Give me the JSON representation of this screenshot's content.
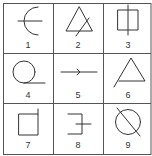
{
  "colors": {
    "grid": "#555555",
    "stroke": "#333333",
    "label": "#333333",
    "background": "#ffffff"
  },
  "grid": {
    "left": 3.5,
    "top": 3.5,
    "right": 151,
    "bottom": 154.5,
    "vlines": [
      53.5,
      103.5
    ],
    "hlines": [
      53.5,
      103.5
    ]
  },
  "cells": [
    {
      "label": "1",
      "label_pos": [
        28,
        40
      ],
      "shapes": [
        {
          "type": "path",
          "d": "M 38 7 A 14 14 0 0 0 38 35"
        },
        {
          "type": "line",
          "x1": 18,
          "y1": 21,
          "x2": 42,
          "y2": 21
        }
      ]
    },
    {
      "label": "2",
      "label_pos": [
        78,
        40
      ],
      "shapes": [
        {
          "type": "polygon",
          "points": "79,7 66,31 92,31"
        },
        {
          "type": "line",
          "x1": 89,
          "y1": 18,
          "x2": 76,
          "y2": 36
        }
      ]
    },
    {
      "label": "3",
      "label_pos": [
        128,
        40
      ],
      "shapes": [
        {
          "type": "rect",
          "x": 118,
          "y": 10,
          "w": 20,
          "h": 20
        },
        {
          "type": "line",
          "x1": 128,
          "y1": 5,
          "x2": 128,
          "y2": 35
        }
      ]
    },
    {
      "label": "4",
      "label_pos": [
        28,
        90
      ],
      "shapes": [
        {
          "type": "circle",
          "cx": 24,
          "cy": 72,
          "r": 11
        },
        {
          "type": "line",
          "x1": 24,
          "y1": 83,
          "x2": 45,
          "y2": 83
        }
      ]
    },
    {
      "label": "5",
      "label_pos": [
        78,
        90
      ],
      "shapes": [
        {
          "type": "line",
          "x1": 61,
          "y1": 72,
          "x2": 97,
          "y2": 72
        },
        {
          "type": "polyline",
          "points": "77,69 80,72 77,75"
        }
      ]
    },
    {
      "label": "6",
      "label_pos": [
        128,
        90
      ],
      "shapes": [
        {
          "type": "polyline",
          "points": "114,87 131,58 145,81 119,81"
        }
      ]
    },
    {
      "label": "7",
      "label_pos": [
        28,
        140
      ],
      "shapes": [
        {
          "type": "rect",
          "x": 19,
          "y": 114,
          "w": 19,
          "h": 21
        },
        {
          "type": "line",
          "x1": 38,
          "y1": 109,
          "x2": 38,
          "y2": 114
        }
      ]
    },
    {
      "label": "8",
      "label_pos": [
        78,
        140
      ],
      "shapes": [
        {
          "type": "polyline",
          "points": "68,114 82,114 82,134 68,134"
        },
        {
          "type": "line",
          "x1": 76,
          "y1": 124,
          "x2": 91,
          "y2": 124
        }
      ]
    },
    {
      "label": "9",
      "label_pos": [
        128,
        140
      ],
      "shapes": [
        {
          "type": "circle",
          "cx": 128,
          "cy": 122,
          "r": 12.5
        },
        {
          "type": "line",
          "x1": 117,
          "y1": 108,
          "x2": 140,
          "y2": 136
        }
      ]
    }
  ]
}
